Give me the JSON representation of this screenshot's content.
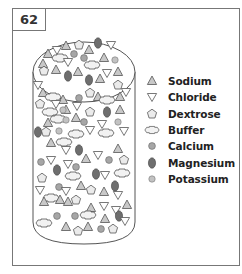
{
  "figure": {
    "number": "62",
    "colors": {
      "sodium": "#c8c8c8",
      "chloride": "#ffffff",
      "dextrose": "#ebebeb",
      "buffer": "#f2f2f2",
      "calcium": "#a6a6a6",
      "magnesium": "#6e6e6e",
      "potassium": "#c2c2c2",
      "outline": "#555555"
    }
  },
  "legend": {
    "items": [
      {
        "key": "sodium",
        "icon": "triangle-up-icon",
        "label": "Sodium"
      },
      {
        "key": "chloride",
        "icon": "triangle-down-icon",
        "label": "Chloride"
      },
      {
        "key": "dextrose",
        "icon": "pentagon-icon",
        "label": "Dextrose"
      },
      {
        "key": "buffer",
        "icon": "buffer-hexagon-icon",
        "label": "Buffer"
      },
      {
        "key": "calcium",
        "icon": "circle-icon",
        "label": "Calcium"
      },
      {
        "key": "magnesium",
        "icon": "oval-icon",
        "label": "Magnesium"
      },
      {
        "key": "potassium",
        "icon": "small-circle-icon",
        "label": "Potassium"
      }
    ]
  }
}
